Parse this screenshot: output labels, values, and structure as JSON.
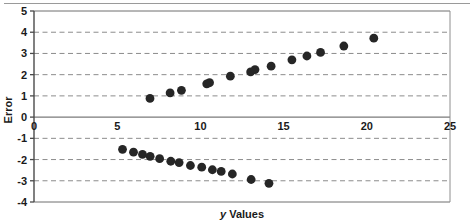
{
  "chart_data": {
    "type": "scatter",
    "title": "",
    "xlabel": "y Values",
    "ylabel": "Error",
    "xlim": [
      0,
      25
    ],
    "ylim": [
      -4,
      5
    ],
    "xticks": [
      0,
      5,
      10,
      15,
      20,
      25
    ],
    "yticks": [
      -4,
      -3,
      -2,
      -1,
      0,
      1,
      2,
      3,
      4,
      5
    ],
    "xtick_labels": [
      "0",
      "5",
      "10",
      "15",
      "20",
      "25"
    ],
    "ytick_labels": [
      "-4",
      "-3",
      "-2",
      "-1",
      "0",
      "1",
      "2",
      "3",
      "4",
      "5"
    ],
    "grid": true,
    "grid_style": "dashed",
    "grid_color": "#8c8c8c",
    "zero_line": true,
    "zero_line_color": "#7a7a7a",
    "frame_color": "#6e6e6e",
    "legend": null,
    "marker_color": "#262626",
    "marker_shape": "circle",
    "marker_size": 4.4,
    "series": [
      {
        "name": "positive-errors",
        "points": [
          [
            6.97,
            0.88
          ],
          [
            8.18,
            1.14
          ],
          [
            8.86,
            1.26
          ],
          [
            10.38,
            1.57
          ],
          [
            10.55,
            1.62
          ],
          [
            11.8,
            1.93
          ],
          [
            13.02,
            2.13
          ],
          [
            13.28,
            2.24
          ],
          [
            14.25,
            2.4
          ],
          [
            15.5,
            2.7
          ],
          [
            16.4,
            2.88
          ],
          [
            17.22,
            3.05
          ],
          [
            18.62,
            3.35
          ],
          [
            20.42,
            3.72
          ]
        ]
      },
      {
        "name": "negative-errors",
        "points": [
          [
            5.32,
            -1.52
          ],
          [
            5.98,
            -1.65
          ],
          [
            6.52,
            -1.76
          ],
          [
            6.98,
            -1.85
          ],
          [
            7.55,
            -1.96
          ],
          [
            8.22,
            -2.08
          ],
          [
            8.72,
            -2.14
          ],
          [
            9.4,
            -2.28
          ],
          [
            10.08,
            -2.36
          ],
          [
            10.72,
            -2.48
          ],
          [
            11.25,
            -2.56
          ],
          [
            11.92,
            -2.68
          ],
          [
            13.05,
            -2.94
          ],
          [
            14.12,
            -3.12
          ]
        ]
      }
    ]
  },
  "axes": {
    "y_axis_label": "Error",
    "x_axis_label_italic": "y",
    "x_axis_label_rest": " Values"
  }
}
